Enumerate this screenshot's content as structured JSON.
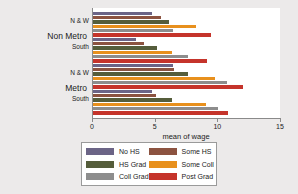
{
  "chart_data": {
    "type": "bar",
    "orientation": "horizontal",
    "title": "",
    "xlabel": "mean of wage",
    "ylabel": "",
    "xlim": [
      0,
      15
    ],
    "xticks": [
      0,
      5,
      10,
      15
    ],
    "xtick_labels": [
      "0",
      "5",
      "10",
      "15"
    ],
    "grid": false,
    "legend_position": "below",
    "outer_groups": [
      "Non Metro",
      "Metro"
    ],
    "inner_groups": [
      "N & W",
      "South"
    ],
    "categories": [
      "Non Metro / N & W",
      "Non Metro / South",
      "Metro / N & W",
      "Metro / South"
    ],
    "series": [
      {
        "name": "No HS",
        "color": "#6b6486",
        "values": [
          4.7,
          3.4,
          6.4,
          4.7
        ]
      },
      {
        "name": "Some HS",
        "color": "#8c5340",
        "values": [
          5.4,
          4.1,
          6.5,
          5.0
        ]
      },
      {
        "name": "HS Grad",
        "color": "#555d3b",
        "values": [
          6.1,
          5.1,
          7.6,
          6.3
        ]
      },
      {
        "name": "Some Coll",
        "color": "#e8901d",
        "values": [
          8.2,
          6.3,
          9.7,
          9.0
        ]
      },
      {
        "name": "Coll Grad",
        "color": "#8d8d8d",
        "values": [
          6.4,
          7.6,
          10.7,
          10.0
        ]
      },
      {
        "name": "Post Grad",
        "color": "#c5342b",
        "values": [
          9.4,
          9.1,
          12.0,
          10.8
        ]
      }
    ]
  },
  "axis": {
    "x_title": "mean of wage",
    "tick_0": "0",
    "tick_5": "5",
    "tick_10": "10",
    "tick_15": "15"
  },
  "groups": {
    "outer_1": "Non Metro",
    "outer_2": "Metro",
    "inner_1": "N & W",
    "inner_2": "South",
    "inner_3": "N & W",
    "inner_4": "South"
  },
  "legend": {
    "left": [
      {
        "label": "No HS",
        "color": "#6b6486"
      },
      {
        "label": "HS Grad",
        "color": "#555d3b"
      },
      {
        "label": "Coll Grad",
        "color": "#8d8d8d"
      }
    ],
    "right": [
      {
        "label": "Some HS",
        "color": "#8c5340"
      },
      {
        "label": "Some Coll",
        "color": "#e8901d"
      },
      {
        "label": "Post Grad",
        "color": "#c5342b"
      }
    ]
  }
}
